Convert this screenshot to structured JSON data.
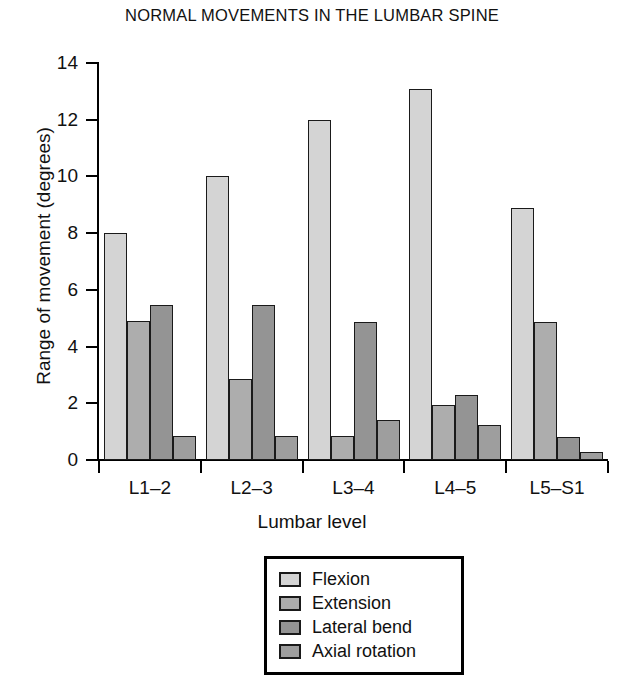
{
  "chart_data": {
    "type": "bar",
    "title": "NORMAL MOVEMENTS IN THE LUMBAR SPINE",
    "xlabel": "Lumbar level",
    "ylabel": "Range of movement (degrees)",
    "categories": [
      "L1–2",
      "L2–3",
      "L3–4",
      "L4–5",
      "L5–S1"
    ],
    "ylim": [
      0,
      14
    ],
    "yticks": [
      0,
      2,
      4,
      6,
      8,
      10,
      12,
      14
    ],
    "ytick_labels": [
      "0",
      "2",
      "4",
      "6",
      "8",
      "10",
      "12",
      "14"
    ],
    "grid": false,
    "legend_position": "bottom-center",
    "series": [
      {
        "name": "Flexion",
        "color": "#d4d4d4",
        "values": [
          8.0,
          10.0,
          12.0,
          13.1,
          8.9
        ]
      },
      {
        "name": "Extension",
        "color": "#adadad",
        "values": [
          4.9,
          2.85,
          0.85,
          1.95,
          4.85
        ]
      },
      {
        "name": "Lateral bend",
        "color": "#949494",
        "values": [
          5.45,
          5.45,
          4.85,
          2.3,
          0.8
        ]
      },
      {
        "name": "Axial rotation",
        "color": "#9e9e9e",
        "values": [
          0.85,
          0.85,
          1.4,
          1.25,
          0.3
        ]
      }
    ]
  },
  "legend": {
    "items": [
      {
        "label": "Flexion",
        "swatch_name": "legend-swatch-flexion"
      },
      {
        "label": "Extension",
        "swatch_name": "legend-swatch-extension"
      },
      {
        "label": "Lateral bend",
        "swatch_name": "legend-swatch-lateral-bend"
      },
      {
        "label": "Axial rotation",
        "swatch_name": "legend-swatch-axial-rotation"
      }
    ]
  }
}
